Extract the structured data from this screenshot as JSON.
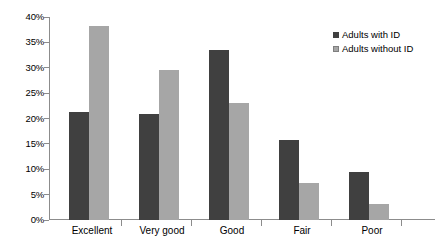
{
  "chart_data": {
    "type": "bar",
    "title": "",
    "xlabel": "",
    "ylabel": "",
    "categories": [
      "Excellent",
      "Very good",
      "Good",
      "Fair",
      "Poor"
    ],
    "series": [
      {
        "name": "Adults with ID",
        "color": "#404040",
        "values": [
          21.2,
          20.8,
          33.5,
          15.8,
          9.5
        ]
      },
      {
        "name": "Adults without ID",
        "color": "#a6a6a6",
        "values": [
          38.2,
          29.5,
          23.0,
          7.3,
          3.2
        ]
      }
    ],
    "ylim": [
      0,
      40
    ],
    "ytick_values": [
      0,
      5,
      10,
      15,
      20,
      25,
      30,
      35,
      40
    ],
    "ytick_labels": [
      "0%",
      "5%",
      "10%",
      "15%",
      "20%",
      "25%",
      "30%",
      "35%",
      "40%"
    ],
    "grid": false,
    "legend_position": "top-right",
    "axis_color": "#8c8c8c"
  }
}
